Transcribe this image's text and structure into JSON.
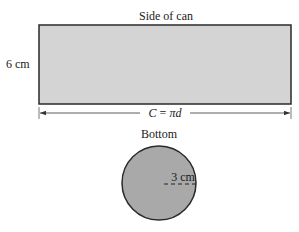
{
  "side": {
    "title": "Side of can",
    "height_label": "6 cm",
    "width_label_prefix": "C = ",
    "width_label_var": "πd",
    "fill": "#d4d4d4",
    "stroke": "#2a2a2a"
  },
  "bottom": {
    "title": "Bottom",
    "radius_label": "3 cm",
    "fill": "#a9a9a9",
    "stroke": "#2a2a2a"
  }
}
